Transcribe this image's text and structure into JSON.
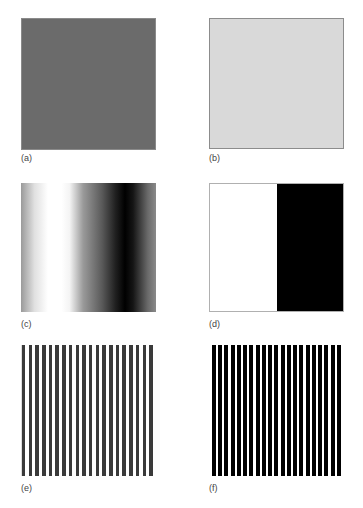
{
  "figure": {
    "panels": [
      {
        "id": "a",
        "label": "(a)",
        "pattern": "uniform",
        "color": "#6b6b6b",
        "shade": "medium-dark gray"
      },
      {
        "id": "b",
        "label": "(b)",
        "pattern": "uniform",
        "color": "#d9d9d9",
        "shade": "light gray"
      },
      {
        "id": "c",
        "label": "(c)",
        "pattern": "horizontal smooth sinusoidal gradient",
        "colors": [
          "#9a9a9a",
          "#ffffff",
          "#000000",
          "#8a8a8a"
        ]
      },
      {
        "id": "d",
        "label": "(d)",
        "pattern": "two-tone vertical split",
        "colors": [
          "#ffffff",
          "#000000"
        ]
      },
      {
        "id": "e",
        "label": "(e)",
        "pattern": "vertical stripes",
        "stripe_count": 20,
        "stripe_color": "#3a3a3a",
        "background_color": "#ffffff"
      },
      {
        "id": "f",
        "label": "(f)",
        "pattern": "vertical stripes",
        "stripe_count": 21,
        "stripe_color": "#000000",
        "background_color": "#ffffff"
      }
    ]
  }
}
